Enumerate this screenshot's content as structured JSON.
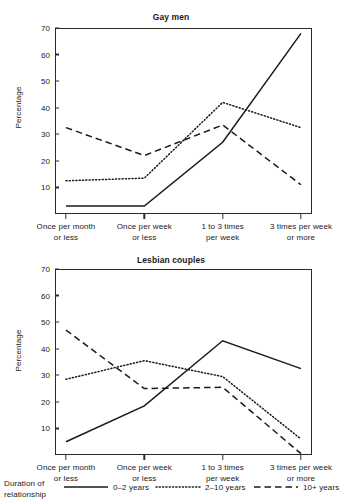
{
  "legend": {
    "title_line1": "Duration of",
    "title_line2": "relationship",
    "entries": [
      {
        "label": "0–2 years",
        "style": "solid"
      },
      {
        "label": "2–10 years",
        "style": "dotted"
      },
      {
        "label": "10+ years",
        "style": "dashed"
      }
    ]
  },
  "chart_data": [
    {
      "type": "line",
      "title": "Gay men",
      "xlabel": "",
      "ylabel": "Percentage",
      "ylim": [
        0,
        70
      ],
      "yticks": [
        10,
        20,
        30,
        40,
        50,
        60,
        70
      ],
      "grid": false,
      "legend_position": "bottom",
      "categories": [
        "Once per month or less",
        "Once per week or less",
        "1 to 3 times per week",
        "3 times per week or more"
      ],
      "category_lines": [
        [
          "Once per month",
          "or less"
        ],
        [
          "Once per week",
          "or less"
        ],
        [
          "1 to 3 times",
          "per week"
        ],
        [
          "3 times per week",
          "or more"
        ]
      ],
      "series": [
        {
          "name": "0–2 years",
          "style": "solid",
          "values": [
            3,
            3,
            27,
            68
          ]
        },
        {
          "name": "2–10 years",
          "style": "dotted",
          "values": [
            12.5,
            13.5,
            42,
            32.5
          ]
        },
        {
          "name": "10+ years",
          "style": "dashed",
          "values": [
            32.5,
            22,
            33.5,
            11
          ]
        }
      ]
    },
    {
      "type": "line",
      "title": "Lesbian couples",
      "xlabel": "",
      "ylabel": "Percentage",
      "ylim": [
        0,
        70
      ],
      "yticks": [
        10,
        20,
        30,
        40,
        50,
        60,
        70
      ],
      "grid": false,
      "legend_position": "bottom",
      "categories": [
        "Once per month or less",
        "Once per week or less",
        "1 to 3 times per week",
        "3 times per week or more"
      ],
      "category_lines": [
        [
          "Once per month",
          "or less"
        ],
        [
          "Once per week",
          "or less"
        ],
        [
          "1 to 3 times",
          "per week"
        ],
        [
          "3 times per week",
          "or more"
        ]
      ],
      "series": [
        {
          "name": "0–2 years",
          "style": "solid",
          "values": [
            5,
            18.5,
            43,
            32.5
          ]
        },
        {
          "name": "2–10 years",
          "style": "dotted",
          "values": [
            28.5,
            35.5,
            29.5,
            6
          ]
        },
        {
          "name": "10+ years",
          "style": "dashed",
          "values": [
            47,
            25,
            25.5,
            0.5
          ]
        }
      ]
    }
  ]
}
